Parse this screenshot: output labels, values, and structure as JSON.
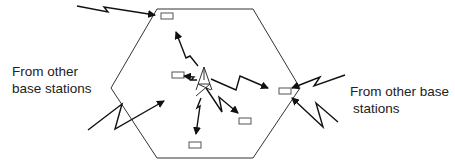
{
  "diagram": {
    "type": "cellular-interference",
    "labels": {
      "left_line1": "From other",
      "left_line2": "base stations",
      "right_line1": "From other base",
      "right_line2": "stations"
    },
    "colors": {
      "line": "#333333",
      "arrow": "#111111",
      "mobile_fill": "#ffffff",
      "mobile_stroke": "#555555",
      "text": "#222222"
    },
    "elements": {
      "cell": "hexagon-cell",
      "base_station": "antenna-tower",
      "mobiles": 6,
      "external_interference_arrows": 4
    }
  }
}
